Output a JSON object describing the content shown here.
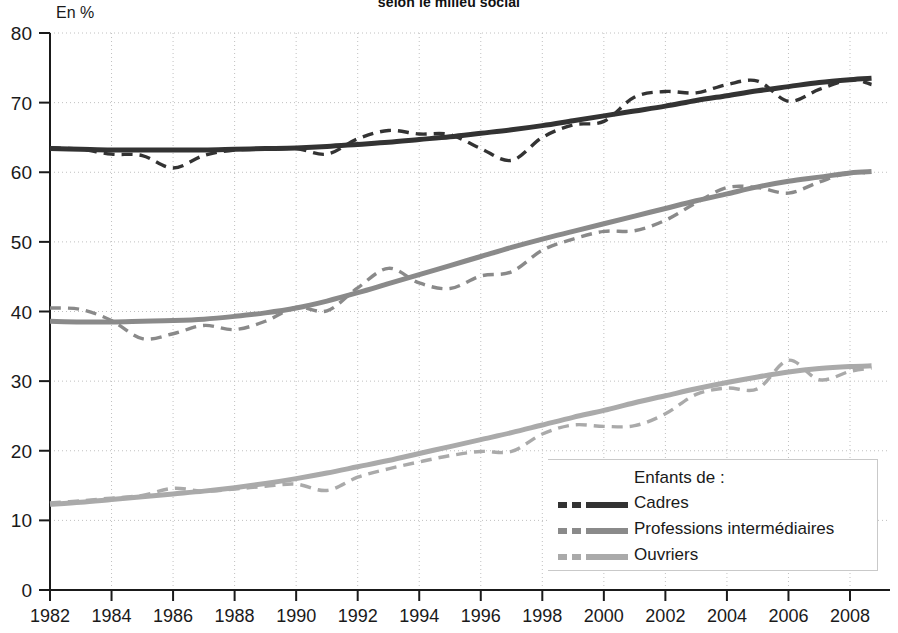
{
  "chart": {
    "title": "selon le milieu social",
    "unit_label": "En %"
  },
  "legend": {
    "title": "Enfants de :",
    "entries": [
      {
        "label": "Cadres",
        "color": "#333333"
      },
      {
        "label": "Professions intermédiaires",
        "color": "#8a8a8a"
      },
      {
        "label": "Ouvriers",
        "color": "#aaaaaa"
      }
    ]
  },
  "chart_data": {
    "type": "line",
    "title": "selon le milieu social",
    "xlabel": "",
    "ylabel": "En %",
    "xlim": [
      1982,
      2008.7
    ],
    "ylim": [
      0,
      80
    ],
    "grid": true,
    "legend_position": "bottom-right",
    "xticks": [
      1982,
      1984,
      1986,
      1988,
      1990,
      1992,
      1994,
      1996,
      1998,
      2000,
      2002,
      2004,
      2006,
      2008
    ],
    "xtick_labels": [
      "1982",
      "1984",
      "1986",
      "1988",
      "1990",
      "1992",
      "1994",
      "1996",
      "1998",
      "2000",
      "2002",
      "2004",
      "2006",
      "2008"
    ],
    "yticks": [
      0,
      10,
      20,
      30,
      40,
      50,
      60,
      70,
      80
    ],
    "ytick_labels": [
      "0",
      "10",
      "20",
      "30",
      "40",
      "50",
      "60",
      "70",
      "80"
    ],
    "x": [
      1982,
      1983,
      1984,
      1985,
      1986,
      1987,
      1988,
      1989,
      1990,
      1991,
      1992,
      1993,
      1994,
      1995,
      1996,
      1997,
      1998,
      1999,
      2000,
      2001,
      2002,
      2003,
      2004,
      2005,
      2006,
      2007,
      2008,
      2008.7
    ],
    "series": [
      {
        "name": "Cadres",
        "style": "dashed",
        "color": "#333333",
        "values": [
          63.5,
          63.3,
          62.6,
          62.4,
          60.6,
          62.4,
          63.2,
          63.3,
          63.4,
          62.6,
          64.8,
          66.0,
          65.5,
          65.4,
          63.4,
          61.7,
          65.0,
          66.8,
          67.3,
          70.8,
          71.6,
          71.4,
          72.6,
          73.1,
          70.2,
          71.9,
          73.3,
          72.6
        ]
      },
      {
        "name": "Cadres (tendance)",
        "style": "solid",
        "color": "#333333",
        "values": [
          63.4,
          63.3,
          63.2,
          63.2,
          63.2,
          63.2,
          63.3,
          63.4,
          63.5,
          63.7,
          64.0,
          64.3,
          64.7,
          65.1,
          65.6,
          66.1,
          66.7,
          67.4,
          68.1,
          68.8,
          69.5,
          70.3,
          71.0,
          71.7,
          72.3,
          72.9,
          73.3,
          73.5
        ]
      },
      {
        "name": "Professions intermédiaires",
        "style": "dashed",
        "color": "#8a8a8a",
        "values": [
          40.5,
          40.3,
          38.7,
          36.1,
          36.8,
          38.0,
          37.4,
          38.6,
          40.6,
          40.1,
          43.4,
          46.2,
          44.1,
          43.3,
          45.1,
          45.7,
          48.8,
          50.4,
          51.5,
          51.6,
          53.1,
          55.6,
          57.8,
          57.8,
          57.0,
          58.6,
          60.0,
          59.8
        ]
      },
      {
        "name": "Professions intermédiaires (tendance)",
        "style": "solid",
        "color": "#8a8a8a",
        "values": [
          38.6,
          38.5,
          38.5,
          38.6,
          38.7,
          38.9,
          39.3,
          39.8,
          40.5,
          41.5,
          42.7,
          44.0,
          45.3,
          46.6,
          47.9,
          49.2,
          50.4,
          51.5,
          52.6,
          53.7,
          54.8,
          55.9,
          56.9,
          57.9,
          58.7,
          59.3,
          59.9,
          60.1
        ]
      },
      {
        "name": "Ouvriers",
        "style": "dashed",
        "color": "#aaaaaa",
        "values": [
          12.5,
          12.8,
          13.2,
          13.6,
          14.6,
          14.2,
          14.5,
          14.9,
          15.2,
          14.3,
          16.2,
          17.4,
          18.4,
          19.3,
          19.9,
          19.9,
          22.4,
          23.7,
          23.5,
          23.6,
          25.3,
          28.1,
          29.0,
          28.9,
          33.0,
          30.2,
          31.4,
          31.9
        ]
      },
      {
        "name": "Ouvriers (tendance)",
        "style": "solid",
        "color": "#aaaaaa",
        "values": [
          12.3,
          12.6,
          13.0,
          13.4,
          13.8,
          14.2,
          14.7,
          15.3,
          16.0,
          16.8,
          17.7,
          18.6,
          19.6,
          20.6,
          21.6,
          22.6,
          23.7,
          24.8,
          25.8,
          26.9,
          27.9,
          28.9,
          29.8,
          30.6,
          31.3,
          31.8,
          32.1,
          32.2
        ]
      }
    ]
  }
}
